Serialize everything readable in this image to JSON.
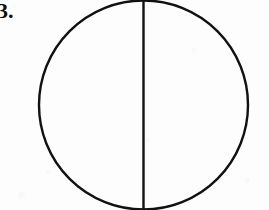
{
  "figure": {
    "label": "3.",
    "caption_present": false,
    "background_color": "#fdfdfd",
    "ink_color": "#111111"
  },
  "chart_data": {
    "type": "diagram",
    "title": "3.",
    "shapes": [
      {
        "name": "circle-outline",
        "kind": "circle",
        "cx": 143.5,
        "cy": 105,
        "r": 104.5,
        "stroke": "#111111",
        "stroke_width": 2.4,
        "fill": "none"
      },
      {
        "name": "vertical-diameter",
        "kind": "line",
        "x1": 143.5,
        "y1": 0.5,
        "x2": 143.5,
        "y2": 209.5,
        "stroke": "#111111",
        "stroke_width": 2.4
      }
    ],
    "regions": [
      {
        "name": "left-half",
        "label": "",
        "fraction": 0.5
      },
      {
        "name": "right-half",
        "label": "",
        "fraction": 0.5
      }
    ],
    "xlabel": "",
    "ylabel": "",
    "grid": false,
    "legend": false
  }
}
